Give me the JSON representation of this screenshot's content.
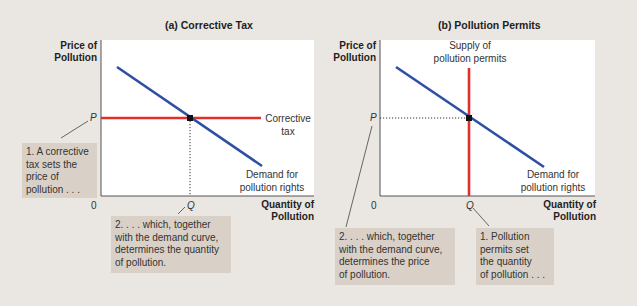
{
  "colors": {
    "background": "#eae6e2",
    "plot_bg": "#ffffff",
    "demand": "#2f4fa5",
    "policy": "#e0302a",
    "callout_bg": "#d9d1c8",
    "axis": "#555555"
  },
  "panels": [
    {
      "title": "(a) Corrective Tax",
      "y_axis_label": [
        "Price of",
        "Pollution"
      ],
      "x_axis_label": [
        "Quantity of",
        "Pollution"
      ],
      "origin_label": "0",
      "price_tick": "P",
      "quantity_tick": "Q",
      "policy_curve_label": [
        "Corrective",
        "tax"
      ],
      "demand_curve_label": [
        "Demand for",
        "pollution rights"
      ],
      "callouts": [
        {
          "lines": [
            "1. A corrective",
            "tax sets the",
            "price of",
            "pollution . . ."
          ]
        },
        {
          "lines": [
            "2. . . . which, together",
            "with the demand curve,",
            "determines the quantity",
            "of pollution."
          ]
        }
      ]
    },
    {
      "title": "(b) Pollution Permits",
      "y_axis_label": [
        "Price of",
        "Pollution"
      ],
      "x_axis_label": [
        "Quantity of",
        "Pollution"
      ],
      "origin_label": "0",
      "price_tick": "P",
      "quantity_tick": "Q",
      "policy_curve_label": [
        "Supply of",
        "pollution permits"
      ],
      "demand_curve_label": [
        "Demand for",
        "pollution rights"
      ],
      "callouts": [
        {
          "lines": [
            "2. . . . which, together",
            "with the demand curve,",
            "determines the price",
            "of pollution."
          ]
        },
        {
          "lines": [
            "1. Pollution",
            "permits set",
            "the quantity",
            "of pollution . . ."
          ]
        }
      ]
    }
  ]
}
